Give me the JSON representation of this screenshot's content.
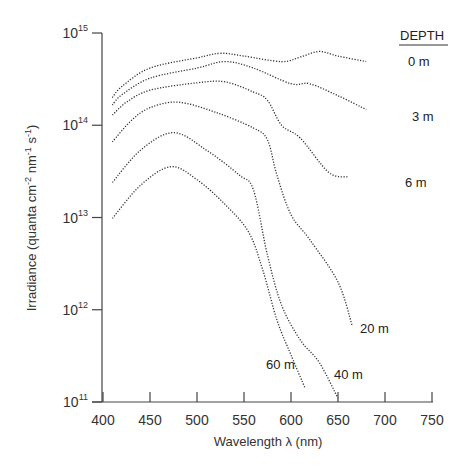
{
  "chart_data": {
    "type": "line",
    "title": "",
    "xlabel": "Wavelength λ (nm)",
    "ylabel": "Irradiance (quanta cm⁻² nm⁻¹ s⁻¹)",
    "ylabel_parts": {
      "base": "Irradiance (quanta cm",
      "e1": "-2",
      "mid1": " nm",
      "e2": "-1",
      "mid2": " s",
      "e3": "-1",
      "end": ")"
    },
    "xlim": [
      400,
      750
    ],
    "ylim_log10": [
      11,
      15
    ],
    "yscale": "log",
    "x_ticks": [
      400,
      450,
      500,
      550,
      600,
      650,
      700,
      750
    ],
    "y_ticks": [
      {
        "base": "10",
        "exp": "15",
        "log": 15
      },
      {
        "base": "10",
        "exp": "14",
        "log": 14
      },
      {
        "base": "10",
        "exp": "13",
        "log": 13
      },
      {
        "base": "10",
        "exp": "12",
        "log": 12
      },
      {
        "base": "10",
        "exp": "11",
        "log": 11
      }
    ],
    "grid": false,
    "legend": {
      "title": "DEPTH",
      "position": "top-right, curve-end labels"
    },
    "series": [
      {
        "name": "0 m",
        "x": [
          410,
          420,
          450,
          500,
          525,
          550,
          590,
          610,
          630,
          650,
          680
        ],
        "log10_values": [
          14.3,
          14.42,
          14.62,
          14.73,
          14.78,
          14.75,
          14.69,
          14.74,
          14.8,
          14.75,
          14.69
        ]
      },
      {
        "name": "3 m",
        "x": [
          410,
          420,
          450,
          500,
          530,
          560,
          600,
          620,
          650,
          680
        ],
        "log10_values": [
          14.22,
          14.33,
          14.51,
          14.62,
          14.69,
          14.62,
          14.45,
          14.45,
          14.32,
          14.17
        ]
      },
      {
        "name": "6 m",
        "x": [
          410,
          425,
          450,
          500,
          530,
          560,
          575,
          590,
          610,
          640,
          660
        ],
        "log10_values": [
          14.11,
          14.25,
          14.38,
          14.46,
          14.47,
          14.36,
          14.27,
          14.0,
          13.86,
          13.49,
          13.44
        ]
      },
      {
        "name": "20 m",
        "x": [
          410,
          430,
          450,
          480,
          520,
          560,
          575,
          585,
          600,
          620,
          650,
          665
        ],
        "log10_values": [
          13.82,
          14.05,
          14.19,
          14.25,
          14.14,
          13.97,
          13.84,
          13.46,
          13.03,
          12.76,
          12.3,
          11.83
        ]
      },
      {
        "name": "40 m",
        "x": [
          410,
          440,
          475,
          510,
          545,
          560,
          575,
          590,
          610,
          630,
          650
        ],
        "log10_values": [
          13.38,
          13.73,
          13.92,
          13.73,
          13.46,
          13.3,
          12.59,
          12.05,
          11.67,
          11.43,
          11.04
        ]
      },
      {
        "name": "60 m",
        "x": [
          410,
          440,
          472,
          500,
          530,
          555,
          570,
          585,
          600,
          615
        ],
        "log10_values": [
          12.99,
          13.35,
          13.55,
          13.41,
          13.14,
          12.84,
          12.43,
          11.89,
          11.51,
          11.15
        ]
      }
    ],
    "labels": [
      {
        "text": "0 m",
        "x": 408,
        "y": 66
      },
      {
        "text": "3 m",
        "x": 412,
        "y": 121
      },
      {
        "text": "6 m",
        "x": 405,
        "y": 187
      },
      {
        "text": "20 m",
        "x": 360,
        "y": 333
      },
      {
        "text": "40 m",
        "x": 334,
        "y": 379
      },
      {
        "text": "60 m",
        "x": 266,
        "y": 369
      }
    ]
  }
}
